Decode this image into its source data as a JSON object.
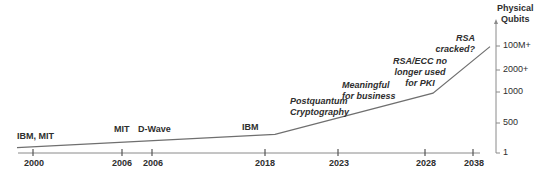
{
  "colors": {
    "line": "#6f6f6f",
    "axis": "#8a8a8a",
    "text": "#2e2e2e"
  },
  "y_axis": {
    "title_line1": "Physical",
    "title_line2": "Qubits",
    "ticks": [
      "100M+",
      "2000+",
      "1000",
      "500",
      "1"
    ]
  },
  "x_axis": {
    "ticks": [
      "2000",
      "2006",
      "2006",
      "2018",
      "2023",
      "2028",
      "2038"
    ]
  },
  "events": [
    {
      "label": "IBM, MIT"
    },
    {
      "label": "MIT"
    },
    {
      "label": "D-Wave"
    },
    {
      "label": "IBM"
    },
    {
      "label_line1": "Postquantum",
      "label_line2": "Cryptography"
    },
    {
      "label_line1": "Meaningful",
      "label_line2": "for business"
    },
    {
      "label_line1": "RSA/ECC no",
      "label_line2": "longer used",
      "label_line3": "for PKI"
    },
    {
      "label_line1": "RSA",
      "label_line2": "cracked?"
    }
  ],
  "chart_data": {
    "type": "line",
    "title": "",
    "xlabel": "",
    "ylabel": "Physical Qubits",
    "x_ticks": [
      "2000",
      "2006",
      "2006",
      "2018",
      "2023",
      "2028",
      "2038"
    ],
    "y_ticks": [
      "1",
      "500",
      "1000",
      "2000+",
      "100M+"
    ],
    "series": [
      {
        "name": "Physical qubits trend",
        "points": [
          {
            "x": "2000",
            "y_level": 0.04
          },
          {
            "x": "2018",
            "y_level": 0.14
          },
          {
            "x": "2028",
            "y_level": 0.45
          },
          {
            "x": "2038",
            "y_level": 0.8
          }
        ]
      }
    ],
    "annotations": [
      "IBM, MIT",
      "MIT",
      "D-Wave",
      "IBM",
      "Postquantum Cryptography",
      "Meaningful for business",
      "RSA/ECC no longer used for PKI",
      "RSA cracked?"
    ],
    "grid": false,
    "legend": "none"
  }
}
